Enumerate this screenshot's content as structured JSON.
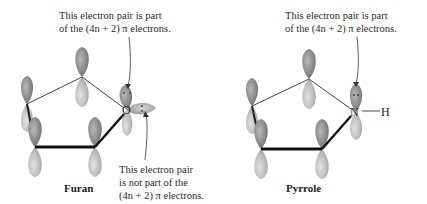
{
  "furan": {
    "title": "Furan",
    "heteroatom": "O",
    "annotation_top": {
      "line1": "This electron pair is part",
      "line2": "of the (4n + 2) π electrons."
    },
    "annotation_bottom": {
      "line1": "This electron pair",
      "line2": "is not part of the",
      "line3": "(4n + 2) π electrons."
    }
  },
  "pyrrole": {
    "title": "Pyrrole",
    "heteroatom": "N",
    "substituent": "H",
    "annotation_top": {
      "line1": "This electron pair is part",
      "line2": "of the (4n + 2) π electrons."
    }
  },
  "colors": {
    "lobe_dark": "#7a7a7a",
    "lobe_light": "#c9c9c9",
    "bond": "#333333"
  }
}
